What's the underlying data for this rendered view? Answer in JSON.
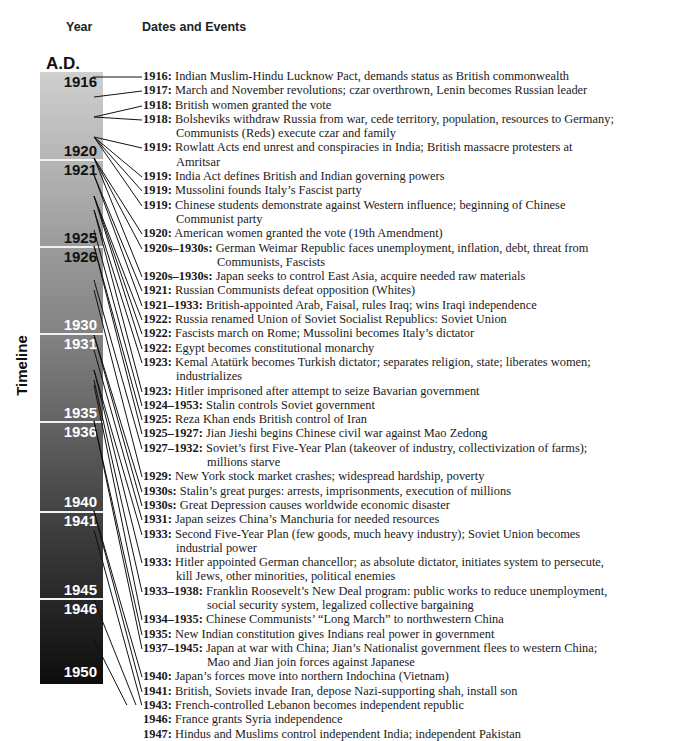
{
  "headers": {
    "year": "Year",
    "events": "Dates and Events"
  },
  "era_label": "A.D.",
  "axis_label": "Timeline",
  "bar": {
    "gradient_top": "#cfcfcf",
    "gradient_bottom": "#0d0d0d",
    "year_marks": [
      {
        "label": "1916",
        "y": 2,
        "color": "#111111"
      },
      {
        "label": "1920",
        "y": 71,
        "color": "#111111"
      },
      {
        "label": "1921",
        "y": 90,
        "color": "#111111"
      },
      {
        "label": "1925",
        "y": 158,
        "color": "#111111"
      },
      {
        "label": "1926",
        "y": 177,
        "color": "#111111"
      },
      {
        "label": "1930",
        "y": 245,
        "color": "#ffffff"
      },
      {
        "label": "1931",
        "y": 264,
        "color": "#ffffff"
      },
      {
        "label": "1935",
        "y": 333,
        "color": "#ffffff"
      },
      {
        "label": "1936",
        "y": 352,
        "color": "#ffffff"
      },
      {
        "label": "1940",
        "y": 422,
        "color": "#ffffff"
      },
      {
        "label": "1941",
        "y": 441,
        "color": "#ffffff"
      },
      {
        "label": "1945",
        "y": 510,
        "color": "#ffffff"
      },
      {
        "label": "1946",
        "y": 529,
        "color": "#ffffff"
      },
      {
        "label": "1950",
        "y": 592,
        "color": "#ffffff"
      }
    ],
    "separators_y": [
      87,
      174,
      261,
      349,
      439,
      526
    ]
  },
  "events": [
    {
      "date": "1916:",
      "text": "Indian Muslim-Hindu Lucknow Pact, demands status as British commonwealth",
      "cont": ""
    },
    {
      "date": "1917:",
      "text": "March and November revolutions; czar overthrown, Lenin becomes Russian leader",
      "cont": ""
    },
    {
      "date": "1918:",
      "text": "British women granted the vote",
      "cont": ""
    },
    {
      "date": "1918:",
      "text": "Bolsheviks withdraw Russia from war, cede territory, population, resources to Germany;",
      "cont": "Communists (Reds) execute czar and family"
    },
    {
      "date": "1919:",
      "text": "Rowlatt Acts end unrest and conspiracies in India; British massacre protesters at",
      "cont": "Amritsar"
    },
    {
      "date": "1919:",
      "text": "India Act defines British and Indian governing powers",
      "cont": ""
    },
    {
      "date": "1919:",
      "text": "Mussolini founds Italy’s Fascist party",
      "cont": ""
    },
    {
      "date": "1919:",
      "text": "Chinese students demonstrate against Western influence; beginning of Chinese",
      "cont": "Communist party"
    },
    {
      "date": "1920:",
      "text": "American women granted the vote (19th Amendment)",
      "cont": ""
    },
    {
      "date": "1920s–1930s:",
      "text": "German Weimar Republic faces unemployment, inflation, debt, threat from",
      "cont": "Communists, Fascists"
    },
    {
      "date": "1920s–1930s:",
      "text": "Japan seeks to control East Asia, acquire needed raw materials",
      "cont": ""
    },
    {
      "date": "1921:",
      "text": "Russian Communists defeat opposition (Whites)",
      "cont": ""
    },
    {
      "date": "1921–1933:",
      "text": "British-appointed Arab, Faisal, rules Iraq; wins Iraqi independence",
      "cont": ""
    },
    {
      "date": "1922:",
      "text": "Russia renamed Union of Soviet Socialist Republics: Soviet Union",
      "cont": ""
    },
    {
      "date": "1922:",
      "text": "Fascists march on Rome; Mussolini becomes Italy’s dictator",
      "cont": ""
    },
    {
      "date": "1922:",
      "text": "Egypt becomes constitutional monarchy",
      "cont": ""
    },
    {
      "date": "1923:",
      "text": "Kemal Atatürk becomes Turkish dictator; separates religion, state; liberates women;",
      "cont": "industrializes"
    },
    {
      "date": "1923:",
      "text": "Hitler imprisoned after attempt to seize Bavarian government",
      "cont": ""
    },
    {
      "date": "1924–1953:",
      "text": "Stalin controls Soviet government",
      "cont": ""
    },
    {
      "date": "1925:",
      "text": "Reza Khan ends British control of Iran",
      "cont": ""
    },
    {
      "date": "1925–1927:",
      "text": "Jian Jieshi begins Chinese civil war against Mao Zedong",
      "cont": ""
    },
    {
      "date": "1927–1932:",
      "text": "Soviet’s first Five-Year Plan (takeover of industry, collectivization of farms);",
      "cont": "millions starve"
    },
    {
      "date": "1929:",
      "text": "New York stock market crashes; widespread hardship, poverty",
      "cont": ""
    },
    {
      "date": "1930s:",
      "text": "Stalin’s great purges: arrests, imprisonments, execution of millions",
      "cont": ""
    },
    {
      "date": "1930s:",
      "text": "Great Depression causes worldwide economic disaster",
      "cont": ""
    },
    {
      "date": "1931:",
      "text": "Japan seizes China’s Manchuria for needed resources",
      "cont": ""
    },
    {
      "date": "1933:",
      "text": "Second Five-Year Plan (few goods, much heavy industry); Soviet Union becomes",
      "cont": "industrial power"
    },
    {
      "date": "1933:",
      "text": "Hitler appointed German chancellor; as absolute dictator, initiates system to persecute,",
      "cont": "kill Jews, other minorities, political enemies"
    },
    {
      "date": "1933–1938:",
      "text": "Franklin Roosevelt’s New Deal program: public works to reduce unemployment,",
      "cont": "social security system, legalized collective bargaining"
    },
    {
      "date": "1934–1935:",
      "text": "Chinese Communists’ “Long March” to northwestern China",
      "cont": ""
    },
    {
      "date": "1935:",
      "text": "New Indian constitution gives Indians real power in government",
      "cont": ""
    },
    {
      "date": "1937–1945:",
      "text": "Japan at war with China; Jian’s Nationalist government flees to western China;",
      "cont": "Mao and Jian join forces against Japanese"
    },
    {
      "date": "1940:",
      "text": "Japan’s forces move into northern Indochina (Vietnam)",
      "cont": ""
    },
    {
      "date": "1941:",
      "text": "British, Soviets invade Iran, depose Nazi-supporting shah, install son",
      "cont": ""
    },
    {
      "date": "1943:",
      "text": "French-controlled Lebanon becomes independent republic",
      "cont": ""
    },
    {
      "date": "1946:",
      "text": "France grants Syria independence",
      "cont": ""
    },
    {
      "date": "1947:",
      "text": "Hindus and Muslims control independent India; independent Pakistan",
      "cont": ""
    }
  ],
  "connector_anchor_y": [
    77,
    97,
    117,
    117,
    137,
    137,
    137,
    137,
    158,
    158,
    158,
    175,
    175,
    196,
    196,
    196,
    210,
    210,
    230,
    246,
    246,
    280,
    290,
    335,
    335,
    350,
    370,
    370,
    380,
    385,
    421,
    421,
    511,
    511,
    530,
    600,
    640
  ]
}
